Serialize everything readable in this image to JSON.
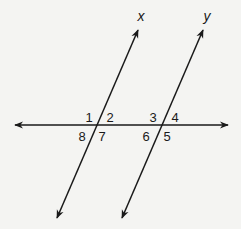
{
  "diagram": {
    "lines": {
      "x": {
        "label": "x",
        "p1": [
          57,
          218
        ],
        "p2": [
          138,
          30
        ]
      },
      "y": {
        "label": "y",
        "p1": [
          122,
          218
        ],
        "p2": [
          203,
          30
        ]
      },
      "transversal": {
        "label": "",
        "p1": [
          15,
          125
        ],
        "p2": [
          228,
          125
        ]
      }
    },
    "intersections": {
      "x": [
        96,
        125
      ],
      "y": [
        161,
        125
      ]
    },
    "angles": [
      {
        "id": "1",
        "label": "1",
        "pos": [
          89,
          117
        ]
      },
      {
        "id": "2",
        "label": "2",
        "pos": [
          110,
          117
        ]
      },
      {
        "id": "3",
        "label": "3",
        "pos": [
          153,
          117
        ]
      },
      {
        "id": "4",
        "label": "4",
        "pos": [
          175,
          117
        ]
      },
      {
        "id": "8",
        "label": "8",
        "pos": [
          82,
          136
        ]
      },
      {
        "id": "7",
        "label": "7",
        "pos": [
          102,
          136
        ]
      },
      {
        "id": "6",
        "label": "6",
        "pos": [
          146,
          136
        ]
      },
      {
        "id": "5",
        "label": "5",
        "pos": [
          167,
          136
        ]
      }
    ],
    "line_labels": [
      {
        "id": "x",
        "label": "x",
        "pos": [
          141,
          16
        ]
      },
      {
        "id": "y",
        "label": "y",
        "pos": [
          207,
          16
        ]
      }
    ],
    "stroke_color": "#1a1a1a",
    "background": "#f4f4f2"
  }
}
